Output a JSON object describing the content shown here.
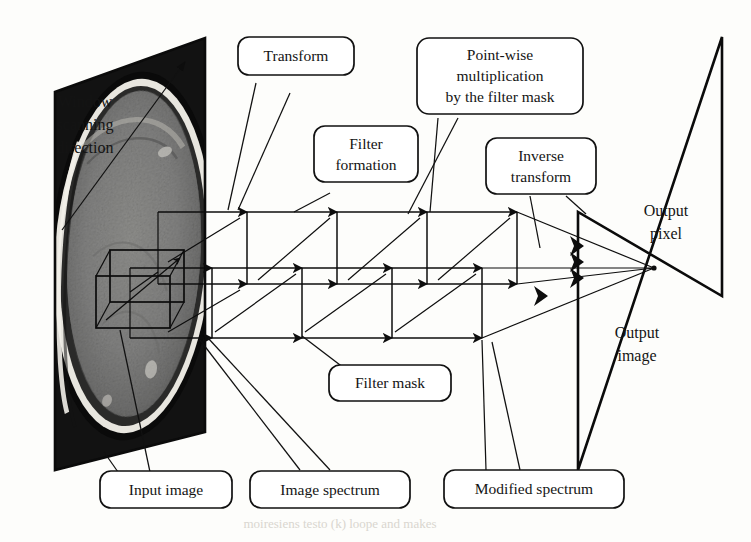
{
  "figure": {
    "kind": "diagram",
    "background_color": "#fdfdfb",
    "ink_color": "#111111"
  },
  "labels": {
    "window_scanning_direction": "Window\nscanning\ndirection",
    "window_scanning_line1": "Window",
    "window_scanning_line2": "scanning",
    "window_scanning_line3": "direction",
    "output_pixel_line1": "Output",
    "output_pixel_line2": "pixel",
    "output_image_line1": "Output",
    "output_image_line2": "image"
  },
  "callouts": [
    {
      "id": "transform",
      "lines": [
        "Transform"
      ],
      "x": 296,
      "y": 56,
      "w": 116,
      "h": 38
    },
    {
      "id": "filter-formation",
      "lines": [
        "Filter",
        "formation"
      ],
      "x": 366,
      "y": 154,
      "w": 104,
      "h": 56
    },
    {
      "id": "point-wise-multiplication",
      "lines": [
        "Point-wise",
        "multiplication",
        "by the filter mask"
      ],
      "x": 500,
      "y": 76,
      "w": 166,
      "h": 76
    },
    {
      "id": "inverse-transform",
      "lines": [
        "Inverse",
        "transform"
      ],
      "x": 541,
      "y": 166,
      "w": 110,
      "h": 56
    },
    {
      "id": "filter-mask",
      "lines": [
        "Filter mask"
      ],
      "x": 390,
      "y": 383,
      "w": 122,
      "h": 36
    },
    {
      "id": "input-image",
      "lines": [
        "Input image"
      ],
      "x": 166,
      "y": 490,
      "w": 132,
      "h": 37
    },
    {
      "id": "image-spectrum",
      "lines": [
        "Image spectrum"
      ],
      "x": 330,
      "y": 490,
      "w": 160,
      "h": 37
    },
    {
      "id": "modified-spectrum",
      "lines": [
        "Modified spectrum"
      ],
      "x": 534,
      "y": 490,
      "w": 180,
      "h": 38
    }
  ],
  "planes": {
    "input_plane_name": "input-image-plane",
    "output_plane_name": "output-image-plane"
  },
  "bleed_through": "moiresiens testo (k) loope and makes"
}
